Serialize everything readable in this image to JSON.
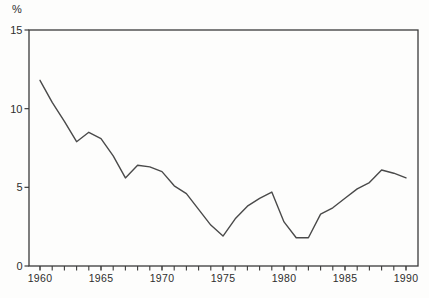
{
  "chart_data": {
    "type": "line",
    "title": "",
    "ylabel": "%",
    "xlabel": "",
    "x": [
      1960,
      1961,
      1962,
      1963,
      1964,
      1965,
      1966,
      1967,
      1968,
      1969,
      1970,
      1971,
      1972,
      1973,
      1974,
      1975,
      1976,
      1977,
      1978,
      1979,
      1980,
      1981,
      1982,
      1983,
      1984,
      1985,
      1986,
      1987,
      1988,
      1989,
      1990
    ],
    "values": [
      11.8,
      10.4,
      9.2,
      7.9,
      8.5,
      8.1,
      7.0,
      5.6,
      6.4,
      6.3,
      6.0,
      5.1,
      4.6,
      3.6,
      2.6,
      1.9,
      3.0,
      3.8,
      4.3,
      4.7,
      2.8,
      1.8,
      1.8,
      3.3,
      3.7,
      4.3,
      4.9,
      5.3,
      6.1,
      5.9,
      5.6
    ],
    "ylim": [
      0,
      15
    ],
    "y_ticks": [
      0,
      5,
      10,
      15
    ],
    "y_tick_labels": [
      "0",
      "5",
      "10",
      "15"
    ],
    "x_major_ticks": [
      1960,
      1965,
      1970,
      1975,
      1980,
      1985,
      1990
    ],
    "x_major_tick_labels": [
      "1960",
      "1965",
      "1970",
      "1975",
      "1980",
      "1985",
      "1990"
    ],
    "x_minor_tick_step": 1,
    "grid": false,
    "legend": "none",
    "frame": "full-box",
    "colors": {
      "line": "#4a4a4a",
      "axis": "#3b3b3b",
      "text": "#2e2e2e",
      "background": "#fdfdfc"
    }
  }
}
